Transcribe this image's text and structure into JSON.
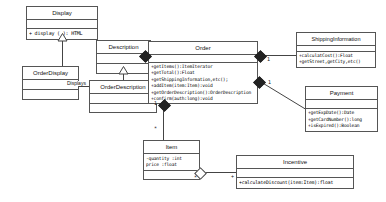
{
  "diagram": {
    "type": "uml-class-diagram",
    "background_color": "#ffffff",
    "border_color": "#555555",
    "line_color": "#444444"
  },
  "classes": {
    "display": {
      "name": "Display",
      "members": [
        "+ display ( ): HTML"
      ]
    },
    "order_display": {
      "name": "OrderDisplay",
      "members": []
    },
    "description": {
      "name": "Description",
      "members": []
    },
    "order_description": {
      "name": "OrderDescription",
      "members": []
    },
    "order": {
      "name": "Order",
      "members": [
        "+getItems():ItemIterator",
        "+getTotal():Float",
        "+getShippingInformation,etc();",
        "+addItem(item:Item):void",
        "+getOrderDescription():OrderDescription",
        "+confirm(auth:long):void"
      ]
    },
    "shipping_information": {
      "name": "ShippingInformation",
      "members": [
        "+calculatCost():Float",
        "+getStreet,getCity,etc()"
      ]
    },
    "payment": {
      "name": "Payment",
      "members": [
        "+getExpDate():Date",
        "+getCardNumber():long",
        "+isExpired():Boolean"
      ]
    },
    "item": {
      "name": "Item",
      "members": [
        "-quantity :int",
        "price :float"
      ]
    },
    "incentive": {
      "name": "Incentive",
      "members": [
        "+calculateDiscount(item:Item):float"
      ]
    }
  },
  "edge_labels": {
    "displays": "Displays"
  },
  "multiplicities": {
    "order_shipping": "1",
    "order_payment": "1",
    "order_item_source": "1",
    "order_item_target": "*",
    "order_incentive_source": "*",
    "order_incentive_target": "+"
  }
}
